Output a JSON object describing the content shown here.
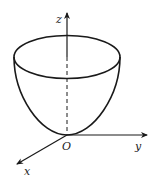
{
  "diagram": {
    "title": "",
    "type": "paraboloid in 3D coordinate system",
    "labels": {
      "z_axis": "z",
      "y_axis": "y",
      "x_axis": "x",
      "origin": "O"
    },
    "colors": {
      "stroke": "#1a1a1a",
      "background": "#ffffff"
    }
  }
}
